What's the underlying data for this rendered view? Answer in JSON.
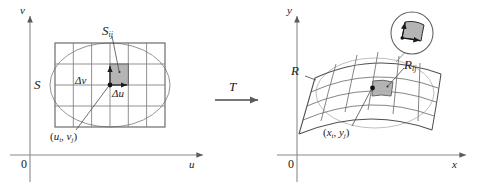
{
  "figure": {
    "colors": {
      "ink": "#1a1a1a",
      "grid": "#6b6b6b",
      "axis": "#7a7a7a",
      "shaded_cell": "#a8a8a8",
      "shaded_cell_fill": "#b3b3b3",
      "ellipse": "#8a8a8a",
      "background": "#ffffff"
    },
    "left_panel": {
      "name": "uv-plane",
      "axis_y_label": "v",
      "axis_x_label": "u",
      "origin_label": "0",
      "region_label": "S",
      "cell_label_base": "S",
      "cell_label_sub": "ij",
      "delta_v_label": "Δv",
      "delta_u_label": "Δu",
      "point_label_open": "(",
      "point_label_u": "u",
      "point_label_u_sub": "i",
      "point_label_comma": ", ",
      "point_label_v": "v",
      "point_label_v_sub": "j",
      "point_label_close": ")",
      "grid_columns": 6,
      "grid_rows": 4
    },
    "arrow": {
      "label": "T",
      "name": "transformation-arrow"
    },
    "right_panel": {
      "name": "xy-plane",
      "axis_y_label": "y",
      "axis_x_label": "x",
      "origin_label": "0",
      "region_label": "R",
      "cell_label_base": "R",
      "cell_label_sub": "ij",
      "point_label_open": "(",
      "point_label_x": "x",
      "point_label_x_sub": "i",
      "point_label_comma": ", ",
      "point_label_y": "y",
      "point_label_y_sub": "j",
      "point_label_close": ")",
      "inset_name": "magnified-cell-inset",
      "grid_columns": 6,
      "grid_rows": 4
    }
  }
}
